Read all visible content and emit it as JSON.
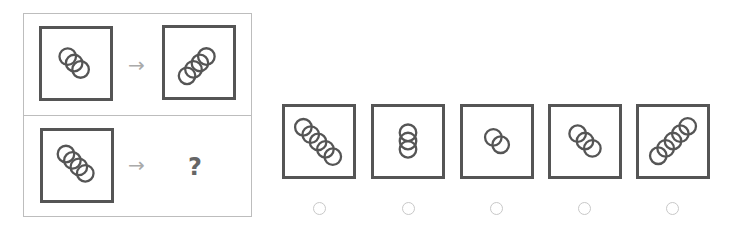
{
  "question": {
    "rows": [
      {
        "left": {
          "circles": 3,
          "direction": "down-right"
        },
        "arrow": "→",
        "right": {
          "circles": 4,
          "direction": "up-right"
        }
      },
      {
        "left": {
          "circles": 4,
          "direction": "down-right"
        },
        "arrow": "→",
        "right": "?"
      }
    ]
  },
  "options": [
    {
      "id": "A",
      "circles": 5,
      "direction": "down-right"
    },
    {
      "id": "B",
      "circles": 3,
      "direction": "vertical"
    },
    {
      "id": "C",
      "circles": 2,
      "direction": "down-right"
    },
    {
      "id": "D",
      "circles": 3,
      "direction": "down-right"
    },
    {
      "id": "E",
      "circles": 5,
      "direction": "up-right"
    }
  ],
  "colors": {
    "stroke": "#555555",
    "arrow": "#aaaaaa",
    "panel_border": "#bdbdbd",
    "radio_border": "#c8c8c8"
  }
}
